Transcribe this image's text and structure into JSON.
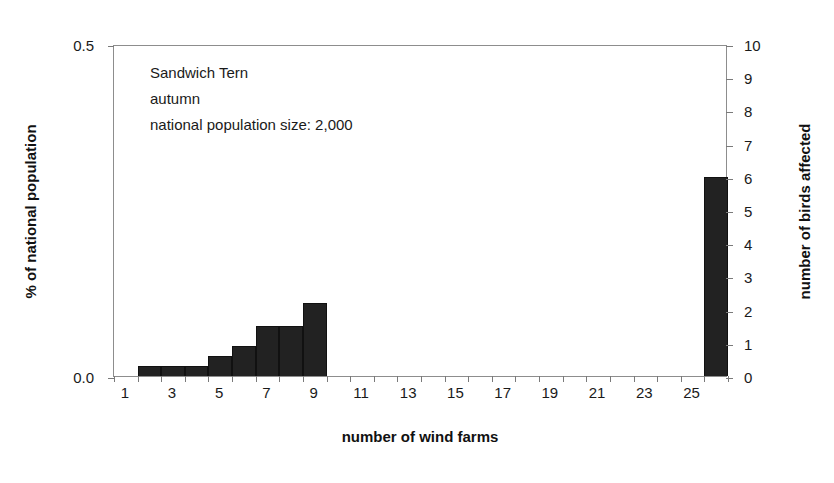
{
  "chart_data": {
    "type": "bar",
    "title": "",
    "xlabel": "number of wind farms",
    "ylabel": "% of national population",
    "y2label": "number of birds affected",
    "grid": false,
    "legend": "none",
    "ylim": [
      0.0,
      0.5
    ],
    "y2lim": [
      0,
      10
    ],
    "xlim": [
      0,
      26
    ],
    "x_tick_labels": [
      "1",
      "3",
      "5",
      "7",
      "9",
      "11",
      "13",
      "15",
      "17",
      "19",
      "21",
      "23",
      "25"
    ],
    "x_tick_values": [
      1,
      3,
      5,
      7,
      9,
      11,
      13,
      15,
      17,
      19,
      21,
      23,
      25
    ],
    "y_tick_labels": [
      "0.0",
      "0.5"
    ],
    "y_tick_values": [
      0.0,
      0.5
    ],
    "y2_tick_labels": [
      "0",
      "1",
      "2",
      "3",
      "4",
      "5",
      "6",
      "7",
      "8",
      "9",
      "10"
    ],
    "y2_tick_values": [
      0,
      1,
      2,
      3,
      4,
      5,
      6,
      7,
      8,
      9,
      10
    ],
    "categories": [
      1,
      2,
      3,
      4,
      5,
      6,
      7,
      8,
      9,
      10,
      11,
      12,
      13,
      14,
      15,
      16,
      17,
      18,
      19,
      20,
      21,
      22,
      23,
      24,
      25,
      26
    ],
    "values_birds": [
      0,
      0.3,
      0.3,
      0.3,
      0.6,
      0.9,
      1.5,
      1.5,
      2.2,
      0,
      0,
      0,
      0,
      0,
      0,
      0,
      0,
      0,
      0,
      0,
      0,
      0,
      0,
      0,
      0,
      6.0
    ],
    "values_percent": [
      0,
      0.015,
      0.015,
      0.015,
      0.03,
      0.045,
      0.075,
      0.075,
      0.11,
      0,
      0,
      0,
      0,
      0,
      0,
      0,
      0,
      0,
      0,
      0,
      0,
      0,
      0,
      0,
      0,
      0.3
    ],
    "bar_color": "#222222",
    "axis_color": "#8d8d8d"
  },
  "annotation": {
    "line1": "Sandwich Tern",
    "line2": "autumn",
    "line3": "national population size: 2,000"
  }
}
